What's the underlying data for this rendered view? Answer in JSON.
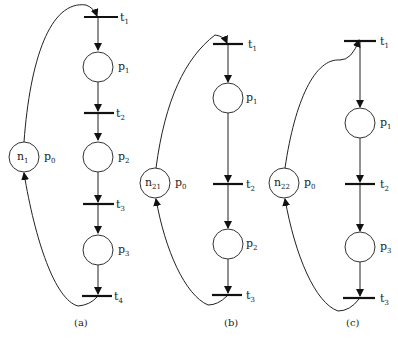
{
  "diagrams": [
    {
      "caption": "(a)",
      "feedback_place": {
        "base": "n",
        "sub": "1",
        "label_base": "p",
        "label_sub": "0"
      },
      "places": [
        {
          "base": "p",
          "sub": "1"
        },
        {
          "base": "p",
          "sub": "2"
        },
        {
          "base": "p",
          "sub": "3"
        }
      ],
      "transitions": [
        {
          "base": "t",
          "sub": "1"
        },
        {
          "base": "t",
          "sub": "2"
        },
        {
          "base": "t",
          "sub": "3"
        },
        {
          "base": "t",
          "sub": "4"
        }
      ]
    },
    {
      "caption": "(b)",
      "feedback_place": {
        "base": "n",
        "sub": "21",
        "label_base": "p",
        "label_sub": "0"
      },
      "places": [
        {
          "base": "p",
          "sub": "1"
        },
        {
          "base": "p",
          "sub": "2"
        }
      ],
      "transitions": [
        {
          "base": "t",
          "sub": "1"
        },
        {
          "base": "t",
          "sub": "2"
        },
        {
          "base": "t",
          "sub": "3"
        }
      ]
    },
    {
      "caption": "(c)",
      "feedback_place": {
        "base": "n",
        "sub": "22",
        "label_base": "p",
        "label_sub": "0"
      },
      "places": [
        {
          "base": "p",
          "sub": "1"
        },
        {
          "base": "p",
          "sub": "3"
        }
      ],
      "transitions": [
        {
          "base": "t",
          "sub": "1"
        },
        {
          "base": "t",
          "sub": "2"
        },
        {
          "base": "t",
          "sub": "3"
        }
      ]
    }
  ]
}
